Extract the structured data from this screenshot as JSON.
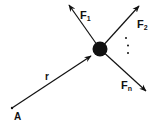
{
  "diagram": {
    "type": "force-diagram",
    "colors": {
      "ink": "#111111",
      "background": "#ffffff"
    },
    "particle": {
      "cx": 100,
      "cy": 49,
      "r": 7.5
    },
    "origin": {
      "label": "A",
      "x": 12,
      "y": 108
    },
    "position_vector": {
      "label": "r",
      "from": [
        12,
        108
      ],
      "to": [
        91,
        56
      ]
    },
    "forces": [
      {
        "label": "F",
        "subscript": "1",
        "from": [
          100,
          49
        ],
        "to": [
          69,
          5
        ]
      },
      {
        "label": "F",
        "subscript": "2",
        "from": [
          100,
          49
        ],
        "to": [
          139,
          6
        ]
      },
      {
        "label": "F",
        "subscript": "n",
        "from": [
          100,
          49
        ],
        "to": [
          146,
          91
        ]
      }
    ],
    "ellipsis": "⋮"
  }
}
